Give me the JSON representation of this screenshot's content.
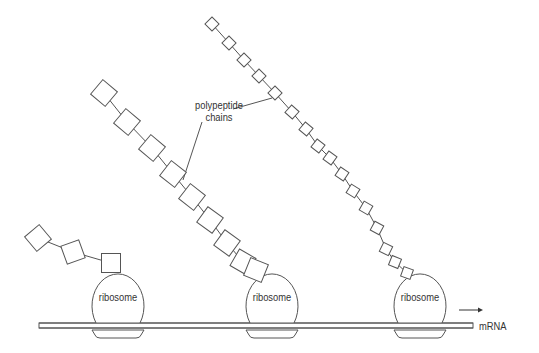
{
  "labels": {
    "callout": [
      "polypeptide",
      "chains"
    ],
    "ribosomes": [
      "ribosome",
      "ribosome",
      "ribosome"
    ],
    "strand": "mRNA"
  },
  "colors": {
    "stroke": "#555555",
    "text": "#333333",
    "background": "#ffffff"
  },
  "direction_arrow": "right",
  "ribosomes": [
    {
      "cx": 118,
      "cy": 297,
      "rx": 36,
      "ry": 32
    },
    {
      "cx": 272,
      "cy": 297,
      "rx": 36,
      "ry": 32
    },
    {
      "cx": 420,
      "cy": 297,
      "rx": 36,
      "ry": 32
    }
  ],
  "chains": [
    {
      "size": 19,
      "squares": [
        [
          38,
          238,
          -40
        ],
        [
          73,
          252,
          -20
        ],
        [
          111,
          263,
          0
        ]
      ]
    },
    {
      "size": 19,
      "squares": [
        [
          104,
          93,
          40
        ],
        [
          127,
          122,
          40
        ],
        [
          152,
          148,
          40
        ],
        [
          173,
          174,
          38
        ],
        [
          192,
          197,
          38
        ],
        [
          210,
          220,
          36
        ],
        [
          227,
          243,
          36
        ],
        [
          243,
          262,
          30
        ],
        [
          256,
          270,
          22
        ]
      ]
    },
    {
      "size": 10,
      "squares": [
        [
          212,
          24,
          45
        ],
        [
          229,
          43,
          45
        ],
        [
          244,
          60,
          45
        ],
        [
          259,
          76,
          45
        ],
        [
          275,
          93,
          45
        ],
        [
          292,
          112,
          42
        ],
        [
          306,
          129,
          40
        ],
        [
          318,
          146,
          38
        ],
        [
          330,
          158,
          36
        ],
        [
          342,
          174,
          34
        ],
        [
          353,
          191,
          32
        ],
        [
          366,
          208,
          30
        ],
        [
          377,
          228,
          28
        ],
        [
          386,
          249,
          26
        ],
        [
          395,
          262,
          22
        ],
        [
          407,
          273,
          20
        ]
      ]
    }
  ]
}
